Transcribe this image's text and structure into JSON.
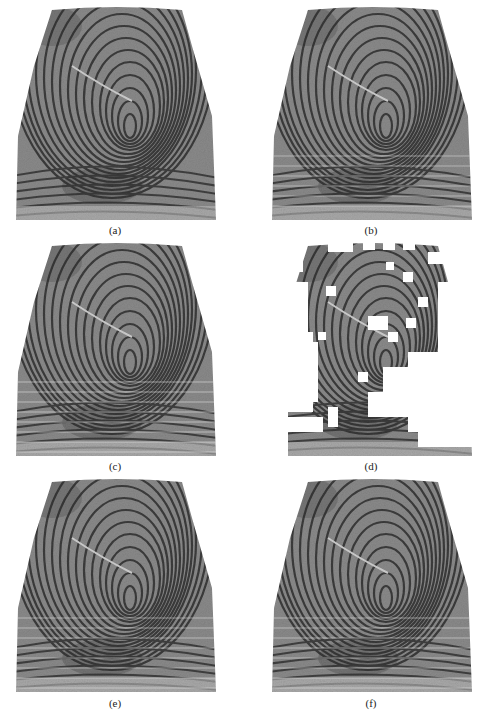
{
  "figure": {
    "panels": [
      {
        "id": "a",
        "label": "(a)",
        "description": "original fingerprint image"
      },
      {
        "id": "b",
        "label": "(b)",
        "description": "enhanced fingerprint with oriented line texture"
      },
      {
        "id": "c",
        "label": "(c)",
        "description": "enhanced fingerprint with oriented line texture"
      },
      {
        "id": "d",
        "label": "(d)",
        "description": "fingerprint with blocks removed (white squares) as mask"
      },
      {
        "id": "e",
        "label": "(e)",
        "description": "enhanced fingerprint"
      },
      {
        "id": "f",
        "label": "(f)",
        "description": "enhanced fingerprint"
      }
    ]
  }
}
